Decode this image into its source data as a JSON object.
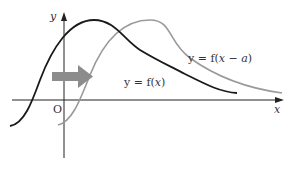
{
  "diagram": {
    "type": "function-translation",
    "axes": {
      "x_label": "x",
      "y_label": "y",
      "origin_label": "O"
    },
    "curves": [
      {
        "name": "original",
        "label_prefix": "y = f(",
        "label_var": "x",
        "label_suffix": ")",
        "color": "#1a1a1a"
      },
      {
        "name": "shifted",
        "label_prefix": "y = f(",
        "label_var": "x − a",
        "label_suffix": ")",
        "color": "#9a9a9a"
      }
    ],
    "shift_arrow": {
      "direction": "right",
      "color": "#8c8c8c"
    }
  }
}
